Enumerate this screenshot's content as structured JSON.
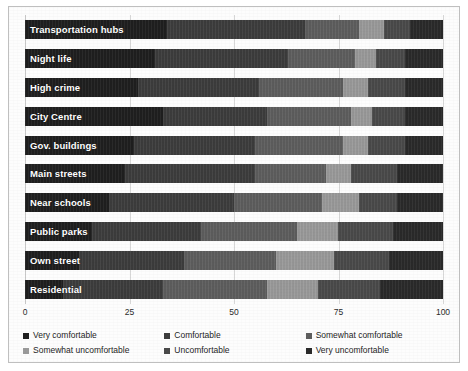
{
  "chart_data": {
    "type": "bar",
    "subtype": "stacked-bar-horizontal-100",
    "title": "",
    "xlabel": "",
    "ylabel": "",
    "xlim": [
      0,
      100
    ],
    "xticks": [
      "0",
      "25",
      "50",
      "75",
      "100"
    ],
    "grid": true,
    "legend_position": "bottom",
    "categories": [
      "Transportation hubs",
      "Night life",
      "High crime",
      "City Centre",
      "Gov. buildings",
      "Main streets",
      "Near schools",
      "Public parks",
      "Own street",
      "Residential"
    ],
    "series": [
      {
        "name": "Very comfortable",
        "color": "#1f1f1f",
        "values": [
          34,
          31,
          27,
          33,
          26,
          24,
          20,
          16,
          13,
          9
        ]
      },
      {
        "name": "Comfortable",
        "color": "#3d3d3d",
        "values": [
          33,
          32,
          29,
          25,
          29,
          31,
          30,
          26,
          25,
          24
        ]
      },
      {
        "name": "Somewhat comfortable",
        "color": "#5e5e5e",
        "values": [
          13,
          16,
          20,
          20,
          21,
          17,
          21,
          23,
          22,
          25
        ]
      },
      {
        "name": "Somewhat uncomfortable",
        "color": "#9a9a9a",
        "values": [
          6,
          5,
          6,
          5,
          6,
          6,
          9,
          10,
          14,
          12
        ]
      },
      {
        "name": "Uncomfortable",
        "color": "#4a4a4a",
        "values": [
          6,
          7,
          9,
          8,
          9,
          11,
          9,
          13,
          13,
          15
        ]
      },
      {
        "name": "Very uncomfortable",
        "color": "#2a2a2a",
        "values": [
          8,
          9,
          9,
          9,
          9,
          11,
          11,
          12,
          13,
          15
        ]
      }
    ]
  },
  "legend": {
    "items": [
      {
        "label": "Very comfortable",
        "color": "#1f1f1f"
      },
      {
        "label": "Comfortable",
        "color": "#3d3d3d"
      },
      {
        "label": "Somewhat comfortable",
        "color": "#5e5e5e"
      },
      {
        "label": "Somewhat uncomfortable",
        "color": "#9a9a9a"
      },
      {
        "label": "Uncomfortable",
        "color": "#4a4a4a"
      },
      {
        "label": "Very uncomfortable",
        "color": "#2a2a2a"
      }
    ]
  },
  "axis": {
    "ticks": [
      {
        "label": "0",
        "value": 0
      },
      {
        "label": "25",
        "value": 25
      },
      {
        "label": "50",
        "value": 50
      },
      {
        "label": "75",
        "value": 75
      },
      {
        "label": "100",
        "value": 100
      }
    ]
  },
  "style": {
    "plot_background": "#fdfdfd",
    "border_color": "#bfbfbf",
    "gridline_color": "#d7d7d7",
    "bar_label_color": "#ffffff"
  }
}
